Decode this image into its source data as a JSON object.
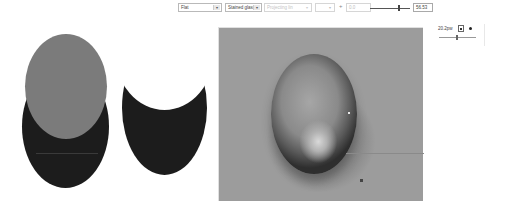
{
  "toolbar": {
    "shading_select": {
      "value": "Flat"
    },
    "material_select": {
      "value": "Stained glass"
    },
    "projection_select": {
      "value": "Projecting lin",
      "enabled": false
    },
    "spinner": {
      "value": "",
      "enabled": false
    },
    "plus_label": "+",
    "text_field": {
      "value": "0.0",
      "enabled": false
    },
    "slider": {
      "position_pct": 72
    },
    "value_box": "56.53"
  },
  "side_panel": {
    "width_field": "20.2pw",
    "toggle_icon": "checkbox-icon",
    "bullet_icon": "dot-icon",
    "slider": {
      "position_pct": 50
    }
  },
  "shapes": {
    "left_ellipse_dark_color": "#1c1c1c",
    "left_ellipse_gray_color": "#7b7b7b",
    "crescent_color": "#1c1c1c"
  },
  "canvas": {
    "background_color": "#9c9c9c",
    "object": "glossy-oval"
  }
}
